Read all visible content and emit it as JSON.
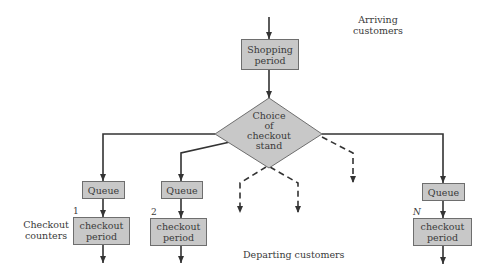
{
  "diagram": {
    "arriving_label": "Arriving customers",
    "arriving_line1": "Arriving",
    "arriving_line2": "customers",
    "shopping": {
      "line1": "Shopping",
      "line2": "period"
    },
    "choice": {
      "line1": "Choice",
      "line2": "of",
      "line3": "checkout",
      "line4": "stand"
    },
    "queues": [
      {
        "label": "Queue",
        "number": "1",
        "checkout_line1": "checkout",
        "checkout_line2": "period"
      },
      {
        "label": "Queue",
        "number": "2",
        "checkout_line1": "checkout",
        "checkout_line2": "period"
      },
      {
        "label": "Queue",
        "number": "N",
        "checkout_line1": "checkout",
        "checkout_line2": "period"
      }
    ],
    "checkout_counters_line1": "Checkout",
    "checkout_counters_line2": "counters",
    "departing_label": "Departing customers",
    "colors": {
      "box_fill": "#c8c8c8",
      "line": "#333333",
      "text": "#3a3a3a"
    }
  }
}
